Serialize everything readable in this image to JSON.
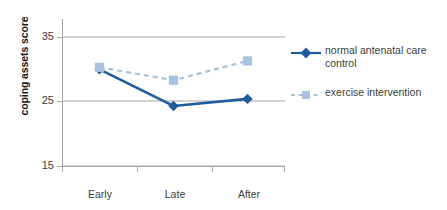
{
  "chart_data": {
    "type": "line",
    "title": "",
    "xlabel": "",
    "ylabel": "coping assets score",
    "categories": [
      "Early pregnancy",
      "Late pregnancy",
      "After pregnancy"
    ],
    "ylim": [
      15,
      35
    ],
    "yticks": [
      15,
      25,
      35
    ],
    "ytick_labels": [
      "15",
      "25",
      "35"
    ],
    "grid": true,
    "grid_axis": "y",
    "legend_position": "right",
    "series": [
      {
        "name": "normal antenatal care control",
        "values": [
          30.0,
          24.3,
          25.4
        ],
        "color": "#1f5c9e",
        "marker": "diamond",
        "linestyle": "solid"
      },
      {
        "name": "exercise intervention",
        "values": [
          30.3,
          28.3,
          31.3
        ],
        "color": "#a8c3dd",
        "marker": "square",
        "linestyle": "dashed"
      }
    ]
  },
  "axis": {
    "y_title": "coping assets score",
    "y_tick_0": "15",
    "y_tick_1": "25",
    "y_tick_2": "35",
    "x_tick_0_line1": "Early",
    "x_tick_0_line2": "pregnancy",
    "x_tick_1_line1": "Late",
    "x_tick_1_line2": "pregnancy",
    "x_tick_2_line1": "After",
    "x_tick_2_line2": "pregnancy"
  },
  "legend": {
    "item_0_line1": "normal antenatal care",
    "item_0_line2": "control",
    "item_1_line1": "exercise intervention"
  },
  "colors": {
    "control": "#1f5c9e",
    "intervention": "#a8c3dd",
    "axis": "#a6a6a6",
    "grid": "#a6a6a6",
    "text": "#3d3d3d"
  }
}
